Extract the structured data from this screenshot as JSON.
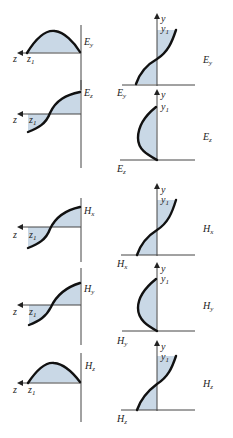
{
  "figure": {
    "colors": {
      "fill": "#c9d8e6",
      "curve": "#111111",
      "axis": "#444444"
    },
    "left_panels": [
      {
        "field": "E",
        "sub": "y",
        "axis_label": "z",
        "marker": "z",
        "marker_sub": "1",
        "shape": "hump"
      },
      {
        "field": "E",
        "sub": "z",
        "axis_label": "z",
        "marker": "z",
        "marker_sub": "1",
        "shape": "s-curve"
      },
      {
        "field": "H",
        "sub": "x",
        "axis_label": "z",
        "marker": "z",
        "marker_sub": "1",
        "shape": "s-curve"
      },
      {
        "field": "H",
        "sub": "y",
        "axis_label": "z",
        "marker": "z",
        "marker_sub": "1",
        "shape": "s-curve"
      },
      {
        "field": "H",
        "sub": "z",
        "axis_label": "z",
        "marker": "z",
        "marker_sub": "1",
        "shape": "hump"
      }
    ],
    "right_panels": [
      {
        "field": "E",
        "sub": "y",
        "axis_label": "y",
        "marker": "y",
        "marker_sub": "1",
        "side_label": "E",
        "side_sub": "y",
        "shape": "s-curve"
      },
      {
        "field": "E",
        "sub": "z",
        "axis_label": "y",
        "marker": "y",
        "marker_sub": "1",
        "side_label": "E",
        "side_sub": "z",
        "shape": "bulge"
      },
      {
        "field": "H",
        "sub": "x",
        "axis_label": "y",
        "marker": "y",
        "marker_sub": "1",
        "side_label": "H",
        "side_sub": "x",
        "shape": "s-curve"
      },
      {
        "field": "H",
        "sub": "y",
        "axis_label": "y",
        "marker": "y",
        "marker_sub": "1",
        "side_label": "H",
        "side_sub": "y",
        "shape": "bulge"
      },
      {
        "field": "H",
        "sub": "z",
        "axis_label": "y",
        "marker": "y",
        "marker_sub": "1",
        "side_label": "H",
        "side_sub": "z",
        "shape": "s-curve"
      }
    ]
  }
}
